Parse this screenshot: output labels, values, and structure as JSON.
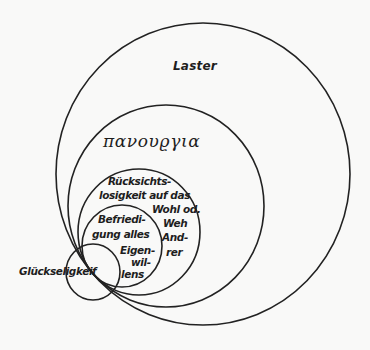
{
  "diagram": {
    "type": "nested-circles",
    "background": "#f9f9f8",
    "stroke_color": "#222222",
    "circles": [
      {
        "id": "laster",
        "label": "Laster",
        "cx": 203,
        "cy": 174,
        "r": 149
      },
      {
        "id": "panourgia",
        "label": "πανουϱγια",
        "cx": 166,
        "cy": 206,
        "r": 100
      },
      {
        "id": "ruecksichtslosigkeit",
        "label": "Rücksichts-losigkeit auf das Wohl od. Weh And-rer",
        "cx": 139,
        "cy": 232,
        "r": 61
      },
      {
        "id": "befriedigung",
        "label": "Befriedi-gung alles Eigen-wil-lens",
        "cx": 122,
        "cy": 246,
        "r": 41
      },
      {
        "id": "glueckseligkeit",
        "label": "Glückseligkeif",
        "cx": 93,
        "cy": 272,
        "r": 28
      }
    ],
    "labels": {
      "laster": "Laster",
      "panourgia": "πανουϱγια",
      "ruecksicht": {
        "line1": "Rücksichts-",
        "line2": "losigkeit auf das",
        "line3": "Wohl od.",
        "line4": "Weh",
        "line5": "And-",
        "line6": "rer"
      },
      "befriedigung": {
        "line1": "Befriedi-",
        "line2": "gung alles",
        "line3": "Eigen-",
        "line4": "wil-",
        "line5": "lens"
      },
      "glueckseligkeit": "Glückseligkeif"
    }
  }
}
